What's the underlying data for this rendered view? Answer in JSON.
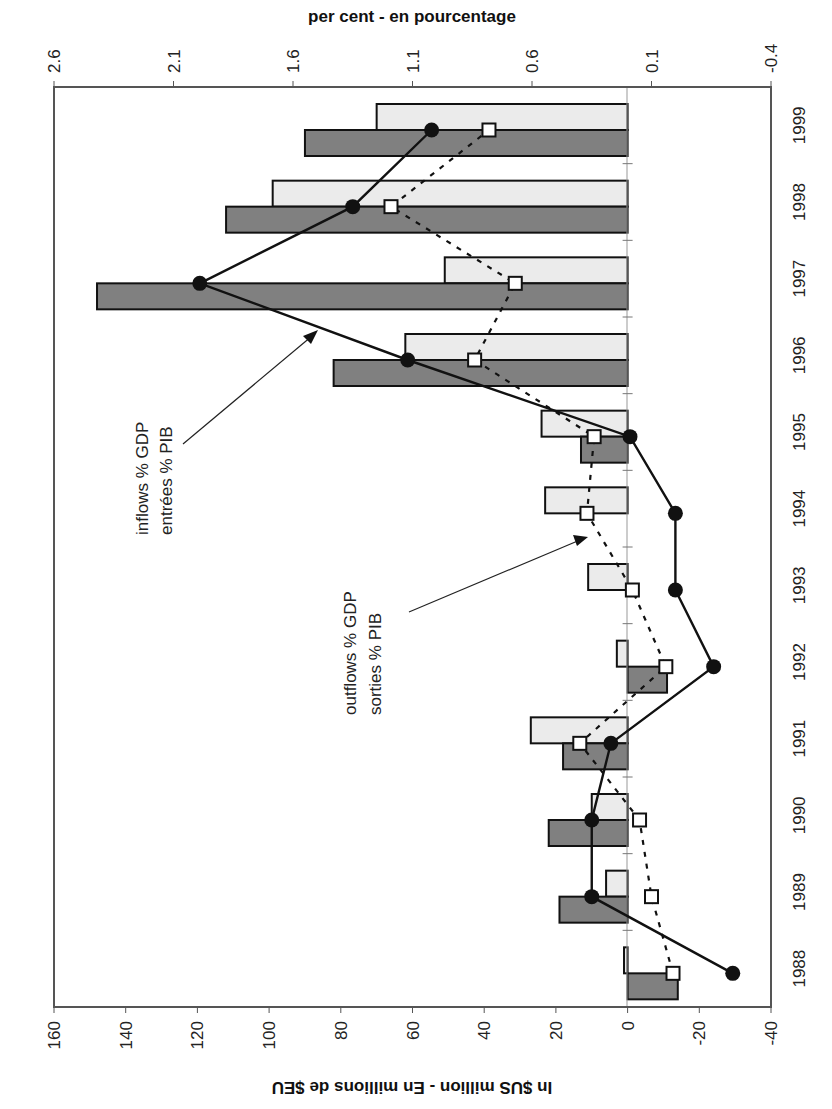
{
  "chart_data": {
    "type": "bar",
    "orientation": "rotated-90-clockwise",
    "title": "",
    "categories": [
      "1988",
      "1989",
      "1990",
      "1991",
      "1992",
      "1993",
      "1994",
      "1995",
      "1996",
      "1997",
      "1998",
      "1999"
    ],
    "series": [
      {
        "name": "inflows",
        "kind": "bar",
        "axis": "primary",
        "color": "#808080",
        "values": [
          -14,
          19,
          22,
          18,
          -11,
          0,
          0,
          13,
          82,
          148,
          112,
          90
        ]
      },
      {
        "name": "outflows",
        "kind": "bar",
        "axis": "primary",
        "color": "#ebebeb",
        "values": [
          1,
          6,
          10,
          27,
          3,
          11,
          23,
          24,
          62,
          51,
          99,
          70
        ]
      },
      {
        "name": "inflows % GDP / entrées % PIB",
        "kind": "line",
        "axis": "secondary",
        "marker": "filled-circle",
        "line_style": "solid",
        "color": "#000000",
        "values": [
          -0.24,
          0.35,
          0.35,
          0.27,
          -0.16,
          0.0,
          0.0,
          0.19,
          1.12,
          1.99,
          1.35,
          1.02
        ]
      },
      {
        "name": "outflows % GDP / sorties % PIB",
        "kind": "line",
        "axis": "secondary",
        "marker": "open-square",
        "line_style": "dashed",
        "color": "#000000",
        "values": [
          0.01,
          0.1,
          0.15,
          0.4,
          0.04,
          0.18,
          0.37,
          0.34,
          0.84,
          0.67,
          1.19,
          0.78
        ]
      }
    ],
    "xlabel": "",
    "ylabel": "In $US million - En millions de $EU",
    "y2label": "per cent - en pourcentage",
    "ylim": [
      -40,
      160
    ],
    "y2lim": [
      -0.4,
      2.6
    ],
    "y_ticks": [
      "160",
      "140",
      "120",
      "100",
      "80",
      "60",
      "40",
      "20",
      "0",
      "-20",
      "-40"
    ],
    "y2_ticks": [
      "2.6",
      "2.1",
      "1.6",
      "1.1",
      "0.6",
      "0.1",
      "-0.4"
    ],
    "grid": false,
    "legend": "none",
    "annotations": [
      {
        "lines": [
          "inflows % GDP",
          "entrées % PIB"
        ],
        "points_to": "inflows % GDP line"
      },
      {
        "lines": [
          "outflows % GDP",
          "sorties % PIB"
        ],
        "points_to": "outflows % GDP line"
      }
    ]
  },
  "axes": {
    "primary_title": "In $US million - En millions de $EU",
    "secondary_title": "per cent - en pourcentage"
  },
  "annotations": {
    "inflows_line1": "inflows % GDP",
    "inflows_line2": "entrées % PIB",
    "outflows_line1": "outflows % GDP",
    "outflows_line2": "sorties % PIB"
  },
  "colors": {
    "inflow_bar": "#808080",
    "outflow_bar": "#ebebeb",
    "line": "#000000",
    "frame": "#555555"
  }
}
